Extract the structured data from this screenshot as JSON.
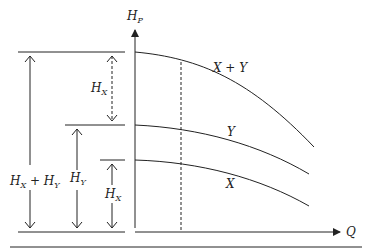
{
  "axes": {
    "y_label": "H",
    "y_label_sub": "P",
    "x_label": "Q"
  },
  "curves": [
    {
      "name": "X + Y",
      "label": "X + Y"
    },
    {
      "name": "Y",
      "label": "Y"
    },
    {
      "name": "X",
      "label": "X"
    }
  ],
  "dimensions": {
    "total": {
      "main": "H",
      "sub1": "X",
      "plus": " + H",
      "sub2": "Y"
    },
    "hx_top": {
      "main": "H",
      "sub": "X"
    },
    "hy": {
      "main": "H",
      "sub": "Y"
    },
    "hx_bottom": {
      "main": "H",
      "sub": "X"
    }
  },
  "colors": {
    "stroke": "#222222",
    "background": "#ffffff"
  }
}
